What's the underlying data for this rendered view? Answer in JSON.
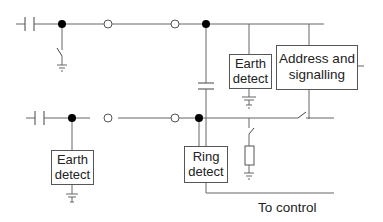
{
  "diagram": {
    "type": "circuit",
    "blocks": {
      "earth_detect_top": {
        "line1": "Earth",
        "line2": "detect"
      },
      "address_signalling": {
        "line1": "Address and",
        "line2": "signalling"
      },
      "earth_detect_bottom": {
        "line1": "Earth",
        "line2": "detect"
      },
      "ring_detect": {
        "line1": "Ring",
        "line2": "detect"
      }
    },
    "labels": {
      "to_control": "To control"
    },
    "colors": {
      "line": "#666666",
      "node": "#000000",
      "text": "#222222"
    }
  }
}
